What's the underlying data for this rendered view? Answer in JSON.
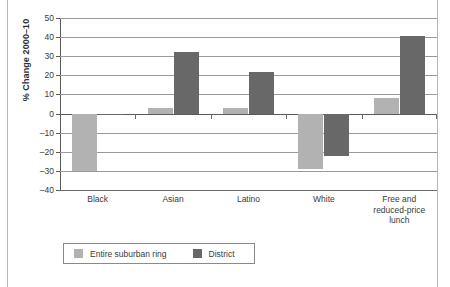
{
  "figure": {
    "background_color": "#ffffff",
    "page_edge_color": "#b9b9b9"
  },
  "chart_data": {
    "type": "bar",
    "title": "",
    "subtitle": "",
    "xlabel": "",
    "ylabel": "% Change 2000–10",
    "ylim": [
      -40,
      50
    ],
    "ytick_step": 10,
    "yticks": [
      50,
      40,
      30,
      20,
      10,
      0,
      -10,
      -20,
      -30,
      -40
    ],
    "ytick_labels": [
      "50",
      "40",
      "30",
      "20",
      "10",
      "0",
      "–10",
      "–20",
      "–30",
      "–40"
    ],
    "grid": true,
    "grid_axis": "y",
    "legend_position": "bottom-left",
    "categories": [
      "Black",
      "Asian",
      "Latino",
      "White",
      "Free and reduced-price lunch"
    ],
    "category_labels": [
      [
        "Black"
      ],
      [
        "Asian"
      ],
      [
        "Latino"
      ],
      [
        "White"
      ],
      [
        "Free and",
        "reduced-price",
        "lunch"
      ]
    ],
    "series": [
      {
        "name": "Entire suburban ring",
        "color": "#b2b2b2",
        "values": [
          -30,
          3,
          3,
          -29,
          8
        ]
      },
      {
        "name": "District",
        "color": "#686868",
        "values": [
          -1,
          32,
          21.5,
          -22,
          40.5
        ]
      }
    ]
  },
  "legend": {
    "items": [
      {
        "label": "Entire suburban ring",
        "color": "#b2b2b2"
      },
      {
        "label": "District",
        "color": "#686868"
      }
    ]
  }
}
